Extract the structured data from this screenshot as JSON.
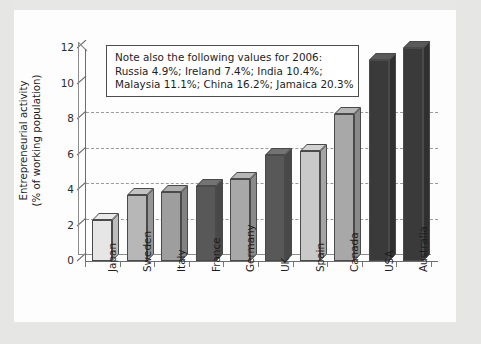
{
  "chart_data": {
    "type": "bar",
    "title": "",
    "xlabel": "",
    "ylabel": "Entrepreneurial activity\n(% of working population)",
    "ylabel_line1": "Entrepreneurial activity",
    "ylabel_line2": "(% of working population)",
    "ylim": [
      0,
      12
    ],
    "yticks": [
      0,
      2,
      4,
      6,
      8,
      10,
      12
    ],
    "ytick_labels": [
      "0",
      "2",
      "4",
      "6",
      "8",
      "10",
      "12"
    ],
    "grid": true,
    "legend": "none",
    "categories": [
      "Japan",
      "Sweden",
      "Italy",
      "France",
      "Germany",
      "UK",
      "Spain",
      "Canada",
      "USA",
      "Australia"
    ],
    "values": [
      2.3,
      3.7,
      3.9,
      4.2,
      4.6,
      6.0,
      6.2,
      8.3,
      11.3,
      12.0
    ],
    "bar_colors": [
      "#e6e6e6",
      "#b7b7b7",
      "#9e9e9e",
      "#585858",
      "#a8a8a8",
      "#585858",
      "#c9c9c9",
      "#a8a8a8",
      "#3a3a3a",
      "#3a3a3a"
    ],
    "annotations": {
      "note_title": "Note also the following values for 2006:",
      "note_line2": "Russia 4.9%; Ireland 7.4%; India 10.4%;",
      "note_line3": "Malaysia 11.1%; China 16.2%; Jamaica 20.3%"
    }
  },
  "figure": {
    "background": "#ebebea",
    "panel_background": "#fdfdfd",
    "axis_color": "#6d6d6d",
    "grid_color": "#9a9a9a",
    "text_color": "#1d1d1d"
  }
}
